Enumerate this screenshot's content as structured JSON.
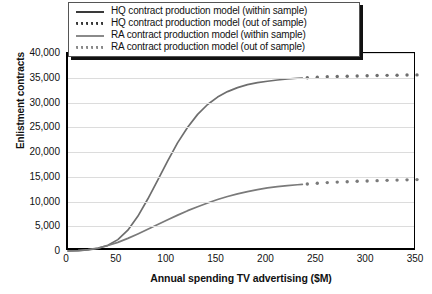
{
  "chart_data": {
    "type": "line",
    "title": "",
    "xlabel": "Annual spending TV advertising ($M)",
    "ylabel": "Enlistment contracts",
    "xlim": [
      0,
      350
    ],
    "ylim": [
      0,
      40000
    ],
    "xticks": [
      0,
      50,
      100,
      150,
      200,
      250,
      300,
      350
    ],
    "xtick_labels": [
      "0",
      "50",
      "100",
      "150",
      "200",
      "250",
      "300",
      "350"
    ],
    "yticks": [
      0,
      5000,
      10000,
      15000,
      20000,
      25000,
      30000,
      35000,
      40000
    ],
    "ytick_labels": [
      "0",
      "5,000",
      "10,000",
      "15,000",
      "20,000",
      "25,000",
      "30,000",
      "35,000",
      "40,000"
    ],
    "grid": "horizontal",
    "legend_position": "top-center",
    "series": [
      {
        "name": "HQ contract production model (within sample)",
        "style": "solid",
        "color": "#6e6e6e",
        "x": [
          0,
          10,
          20,
          30,
          40,
          50,
          60,
          70,
          80,
          90,
          100,
          110,
          120,
          130,
          140,
          150,
          160,
          170,
          180,
          190,
          200,
          210,
          220,
          230,
          235
        ],
        "y": [
          0,
          60,
          200,
          520,
          1150,
          2300,
          4200,
          7000,
          10500,
          14300,
          18200,
          21900,
          25000,
          27600,
          29600,
          31100,
          32200,
          33000,
          33600,
          34000,
          34300,
          34550,
          34750,
          34900,
          34950
        ]
      },
      {
        "name": "HQ contract production model (out of sample)",
        "style": "dotted",
        "color": "#6e6e6e",
        "x": [
          240,
          250,
          260,
          270,
          280,
          290,
          300,
          310,
          320,
          330,
          340,
          350
        ],
        "y": [
          35000,
          35100,
          35200,
          35250,
          35300,
          35350,
          35400,
          35450,
          35480,
          35520,
          35550,
          35580
        ]
      },
      {
        "name": "RA contract production model (within sample)",
        "style": "solid",
        "color": "#7a7a7a",
        "x": [
          0,
          10,
          20,
          30,
          40,
          50,
          60,
          70,
          80,
          90,
          100,
          110,
          120,
          130,
          140,
          150,
          160,
          170,
          180,
          190,
          200,
          210,
          220,
          230,
          235
        ],
        "y": [
          0,
          80,
          260,
          600,
          1100,
          1750,
          2550,
          3450,
          4400,
          5350,
          6300,
          7250,
          8150,
          8950,
          9700,
          10400,
          11000,
          11550,
          12000,
          12400,
          12750,
          13000,
          13200,
          13380,
          13450
        ]
      },
      {
        "name": "RA contract production model (out of sample)",
        "style": "dotted",
        "color": "#7a7a7a",
        "x": [
          240,
          250,
          260,
          270,
          280,
          290,
          300,
          310,
          320,
          330,
          340,
          350
        ],
        "y": [
          13550,
          13700,
          13820,
          13920,
          14000,
          14080,
          14150,
          14210,
          14270,
          14320,
          14370,
          14420
        ]
      }
    ]
  },
  "legend": {
    "items": [
      {
        "label": "HQ contract production model (within sample)",
        "style": "solid",
        "color": "#3a3a3a"
      },
      {
        "label": "HQ contract production model (out of sample)",
        "style": "dotted",
        "color": "#3a3a3a"
      },
      {
        "label": "RA contract production model (within sample)",
        "style": "solid",
        "color": "#8a8a8a"
      },
      {
        "label": "RA contract production model (out of sample)",
        "style": "dotted",
        "color": "#8a8a8a"
      }
    ]
  },
  "axes": {
    "x_title": "Annual spending TV advertising ($M)",
    "y_title": "Enlistment contracts"
  }
}
